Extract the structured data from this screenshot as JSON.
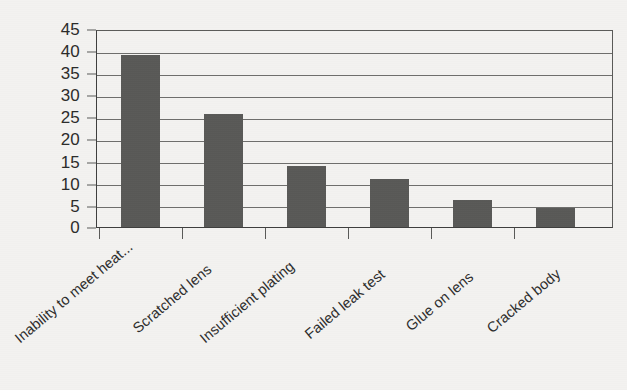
{
  "chart_data": {
    "type": "bar",
    "title": "",
    "subtitle": "",
    "xlabel": "",
    "ylabel": "",
    "categories": [
      "Inability to meet heat...",
      "Scratched lens",
      "Insufficient plating",
      "Failed leak test",
      "Glue on lens",
      "Cracked body"
    ],
    "values": [
      39,
      25.7,
      13.8,
      11,
      6.1,
      4.4
    ],
    "ylim": [
      0,
      45
    ],
    "ytick_labels": [
      "0",
      "5",
      "10",
      "15",
      "20",
      "25",
      "30",
      "35",
      "40",
      "45"
    ],
    "ytick_values": [
      0,
      5,
      10,
      15,
      20,
      25,
      30,
      35,
      40,
      45
    ],
    "grid": true,
    "legend": "none",
    "legend_position": "none",
    "orientation": "vertical",
    "bar_color": "#595957",
    "grid_color": "#6f6f6d",
    "axis_color": "#3f3f3e",
    "background_color": "#f3f2f0",
    "text_color": "#2b2b2a",
    "xtick_label_rotation": -40
  }
}
